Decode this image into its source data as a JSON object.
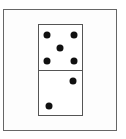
{
  "diagram": {
    "type": "domino",
    "top_half": {
      "value": 5
    },
    "bottom_half": {
      "value": 2
    },
    "pips": [
      {
        "x": 47,
        "y": 35
      },
      {
        "x": 74,
        "y": 35
      },
      {
        "x": 60,
        "y": 48
      },
      {
        "x": 47,
        "y": 61
      },
      {
        "x": 74,
        "y": 61
      },
      {
        "x": 73,
        "y": 81
      },
      {
        "x": 49,
        "y": 106
      }
    ]
  }
}
